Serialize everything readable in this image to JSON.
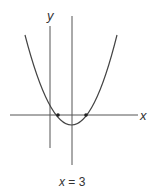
{
  "diagram": {
    "type": "parabola-graph",
    "axis_labels": {
      "x": "x",
      "y": "y"
    },
    "symmetry_line_label_var": "x",
    "symmetry_line_label_rest": " = 3",
    "curve": {
      "description": "Upward-opening parabola crossing x-axis at two points, with a positive y-intercept, and axis of symmetry x = 3",
      "points_marked": [
        "left x-intercept",
        "right x-intercept"
      ]
    },
    "colors": {
      "stroke": "#444444",
      "text": "#333333",
      "background": "#ffffff"
    }
  }
}
